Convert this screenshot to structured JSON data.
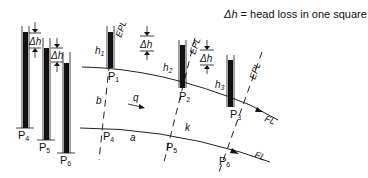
{
  "legend": {
    "symbol": "Δh",
    "text": "= head loss in one square"
  },
  "delta_h_label": "Δh",
  "points": {
    "p1": "P",
    "p1_sub": "1",
    "p2": "P",
    "p2_sub": "2",
    "p3": "P",
    "p3_sub": "3",
    "p4": "P",
    "p4_sub": "4",
    "p5": "P",
    "p5_sub": "5",
    "p6": "P",
    "p6_sub": "6"
  },
  "heads": {
    "h1": "h",
    "h1_sub": "1",
    "h2": "h",
    "h2_sub": "2",
    "h3": "h",
    "h3_sub": "3"
  },
  "lines": {
    "epl": "EPL",
    "fl": "FL"
  },
  "labels": {
    "b": "b",
    "q": "q",
    "k": "k",
    "a": "a"
  }
}
